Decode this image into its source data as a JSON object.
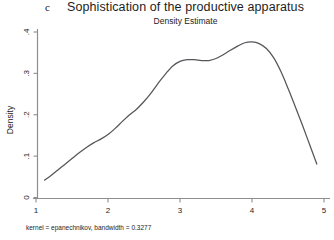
{
  "figure": {
    "panel_letter": "c",
    "title": "Sophistication of the productive apparatus",
    "subtitle": "Density Estimate",
    "note": "kernel = epanechnikov, bandwidth = 0.3277"
  },
  "chart_data": {
    "type": "line",
    "title": "Sophistication of the productive apparatus",
    "subtitle": "Density Estimate",
    "xlabel": "",
    "ylabel": "Density",
    "xlim": [
      0.95,
      5.05
    ],
    "ylim": [
      0,
      0.42
    ],
    "xticks": [
      "1",
      "2",
      "3",
      "4",
      "5"
    ],
    "xtick_values": [
      1,
      2,
      3,
      4,
      5
    ],
    "yticks": [
      "0",
      ".1",
      ".2",
      ".3",
      ".4"
    ],
    "ytick_values": [
      0,
      0.1,
      0.2,
      0.3,
      0.4
    ],
    "grid": false,
    "legend": null,
    "annotation": "kernel = epanechnikov, bandwidth = 0.3277",
    "line_color": "#55555a",
    "series": [
      {
        "name": "Density",
        "x": [
          1.12,
          1.2,
          1.3,
          1.4,
          1.5,
          1.6,
          1.7,
          1.8,
          1.9,
          2.0,
          2.1,
          2.2,
          2.3,
          2.4,
          2.5,
          2.6,
          2.7,
          2.8,
          2.9,
          3.0,
          3.1,
          3.2,
          3.3,
          3.4,
          3.5,
          3.6,
          3.7,
          3.8,
          3.9,
          4.0,
          4.1,
          4.2,
          4.3,
          4.4,
          4.5,
          4.6,
          4.7,
          4.8,
          4.9
        ],
        "y": [
          0.042,
          0.052,
          0.066,
          0.08,
          0.094,
          0.108,
          0.121,
          0.132,
          0.141,
          0.152,
          0.167,
          0.184,
          0.2,
          0.214,
          0.232,
          0.253,
          0.277,
          0.299,
          0.318,
          0.329,
          0.333,
          0.333,
          0.331,
          0.331,
          0.336,
          0.345,
          0.356,
          0.366,
          0.374,
          0.376,
          0.372,
          0.36,
          0.338,
          0.305,
          0.264,
          0.22,
          0.175,
          0.128,
          0.081
        ]
      }
    ]
  }
}
